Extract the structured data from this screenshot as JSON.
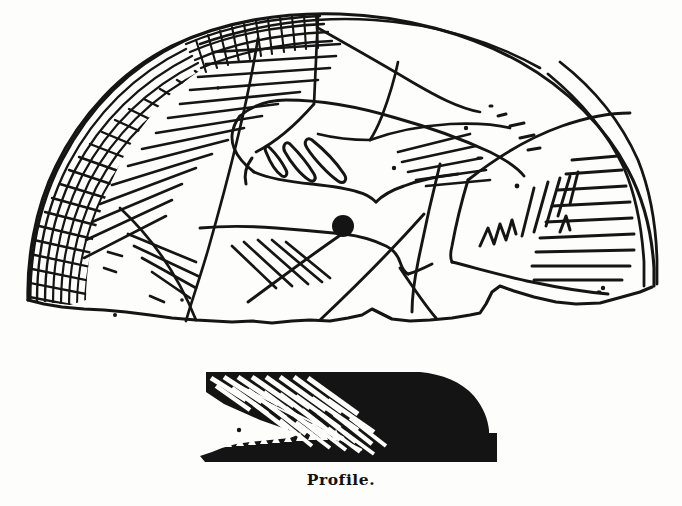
{
  "figure": {
    "kind": "antique-engraving-illustration",
    "background_color": "#fdfdfb",
    "ink_color": "#151515",
    "views": [
      {
        "id": "face-view",
        "label": "",
        "description": "Semicircular / fan shaped shell gorget with incised decoration, cross-hatched band at left, a drilled perforation near the centre, feather and hand motifs, hatched panels and a double-line rim at the right."
      },
      {
        "id": "profile-view",
        "label": "Profile.",
        "description": "Solid black cross-section silhouette with reversed-out diagonal hatch stripes at the left and a serrated lower edge."
      }
    ]
  },
  "caption": {
    "text": "Profile."
  },
  "face_view": {
    "perforation": {
      "label": "drilled suspension hole",
      "cx": 343,
      "cy": 226,
      "r": 11
    },
    "motifs": [
      "cross-hatched grid band",
      "parallel hatch strokes",
      "feather / plume loops",
      "zigzag element",
      "double-line rim"
    ]
  },
  "profile_view": {
    "features": [
      "solid black silhouette",
      "white diagonal hatch stripes",
      "serrated lower edge",
      "stepped right terminal"
    ]
  }
}
